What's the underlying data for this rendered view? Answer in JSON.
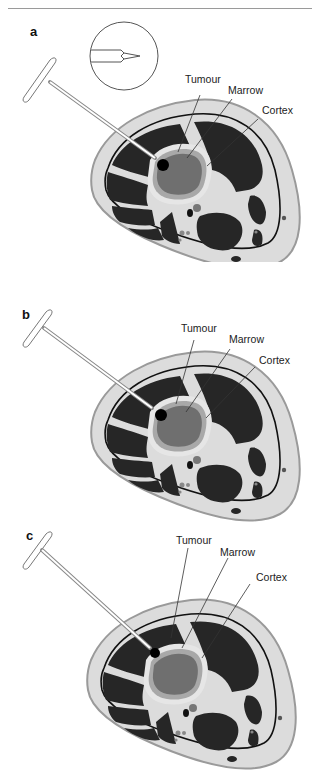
{
  "figure": {
    "colors": {
      "soft_tissue": "#dcdcdc",
      "skin_edge": "#9a9a9a",
      "muscle": "#262626",
      "fascia_line": "#111111",
      "cortex": "#e6e6e6",
      "marrow_ring": "#a8a8a8",
      "tumour": "#6f6f6f",
      "needle_tip": "#000000"
    },
    "panels": [
      {
        "letter": "a",
        "labels": {
          "tumour": "Tumour",
          "marrow": "Marrow",
          "cortex": "Cortex"
        },
        "inset": true
      },
      {
        "letter": "b",
        "labels": {
          "tumour": "Tumour",
          "marrow": "Marrow",
          "cortex": "Cortex"
        },
        "inset": false
      },
      {
        "letter": "c",
        "labels": {
          "tumour": "Tumour",
          "marrow": "Marrow",
          "cortex": "Cortex"
        },
        "inset": false
      }
    ]
  }
}
